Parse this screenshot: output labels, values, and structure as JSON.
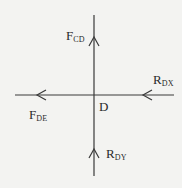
{
  "diagram": {
    "joint": {
      "label": "D"
    },
    "forces": [
      {
        "id": "F_CD",
        "main": "F",
        "sub": "CD",
        "direction": "up",
        "position": "top"
      },
      {
        "id": "F_DE",
        "main": "F",
        "sub": "DE",
        "direction": "left",
        "position": "left"
      },
      {
        "id": "R_DX",
        "main": "R",
        "sub": "DX",
        "direction": "left",
        "position": "right"
      },
      {
        "id": "R_DY",
        "main": "R",
        "sub": "DY",
        "direction": "up",
        "position": "bottom"
      }
    ],
    "colors": {
      "line": "#3a3a3a",
      "background": "#f3f3f1",
      "text": "#2a2a2a"
    }
  }
}
